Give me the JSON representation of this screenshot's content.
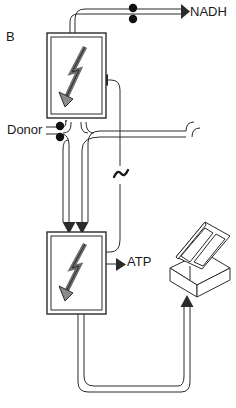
{
  "figure": {
    "panel_label": "B",
    "caption_labels": {
      "nadh": "NADH",
      "donor": "Donor",
      "atp": "ATP",
      "high_energy_bond": "~"
    },
    "colors": {
      "stroke": "#2b2b2b",
      "fill": "#ffffff",
      "background": "#ffffff",
      "dot": "#111111"
    },
    "nodes": [
      {
        "id": "upper-complex",
        "name": "upper-reaction-box",
        "symbol": "lightning-bolt-arrow",
        "x": 47,
        "y": 33,
        "width": 59,
        "height": 85
      },
      {
        "id": "lower-complex",
        "name": "lower-reaction-box",
        "symbol": "lightning-bolt-arrow",
        "x": 47,
        "y": 232,
        "width": 59,
        "height": 82
      },
      {
        "id": "solar-panel",
        "name": "solar-panel-device",
        "x": 168,
        "y": 222,
        "width": 62,
        "height": 73
      }
    ],
    "electron_pairs": [
      {
        "id": "nadh-electrons",
        "count": 2,
        "x": 132,
        "y": 13
      },
      {
        "id": "donor-electrons",
        "count": 2,
        "x": 59,
        "y": 130
      }
    ],
    "flows": [
      {
        "id": "upper-to-nadh",
        "from": "upper-complex",
        "to": "nadh",
        "direction": "right"
      },
      {
        "id": "donor-to-upper",
        "from": "donor",
        "to": "upper-complex",
        "direction": "up"
      },
      {
        "id": "donor-to-lower",
        "from": "donor",
        "to": "lower-complex",
        "direction": "down"
      },
      {
        "id": "lower-to-atp",
        "from": "lower-complex",
        "to": "atp",
        "direction": "right"
      },
      {
        "id": "lower-to-solar",
        "from": "lower-complex",
        "to": "solar-panel",
        "direction": "up"
      },
      {
        "id": "solar-to-upper",
        "from": "solar-panel",
        "to": "upper-complex",
        "direction": "left"
      }
    ]
  }
}
